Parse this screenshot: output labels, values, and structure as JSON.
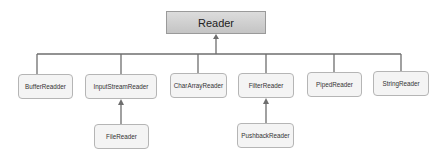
{
  "diagram": {
    "type": "class-hierarchy",
    "root": {
      "label": "Reader"
    },
    "children": [
      {
        "label": "BufferReadder"
      },
      {
        "label": "InputStreamReader",
        "children": [
          {
            "label": "FileReader"
          }
        ]
      },
      {
        "label": "CharArrayReader"
      },
      {
        "label": "FilterReader",
        "children": [
          {
            "label": "PushbackReader"
          }
        ]
      },
      {
        "label": "PipedReader"
      },
      {
        "label": "StringReader"
      }
    ],
    "colors": {
      "root_fill": "#cfcfcf",
      "node_fill": "#f4f4f4",
      "border": "#b5b5b5",
      "line": "#6e6e6e"
    }
  }
}
